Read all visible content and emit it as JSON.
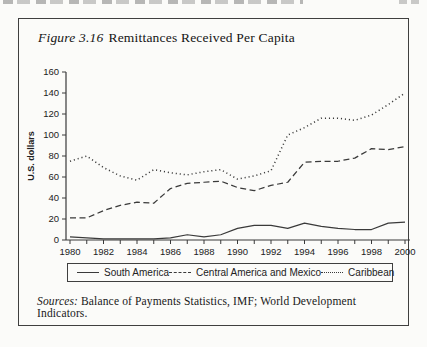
{
  "figure": {
    "label": "Figure 3.16",
    "title": "Remittances Received Per Capita",
    "sources_label": "Sources:",
    "sources_text": "Balance of Payments Statistics, IMF; World Development Indicators."
  },
  "chart_data": {
    "type": "line",
    "title": "Remittances Received Per Capita",
    "xlabel": "",
    "ylabel": "U.S. dollars",
    "ylim": [
      0,
      160
    ],
    "ytick_step": 20,
    "grid": false,
    "legend_position": "bottom",
    "axis_color": "#3a3a3a",
    "line_color": "#3a3a3a",
    "x": [
      1980,
      1981,
      1982,
      1983,
      1984,
      1985,
      1986,
      1987,
      1988,
      1989,
      1990,
      1991,
      1992,
      1993,
      1994,
      1995,
      1996,
      1997,
      1998,
      1999,
      2000
    ],
    "xtick_labels": [
      "1980",
      "1982",
      "1984",
      "1986",
      "1988",
      "1990",
      "1992",
      "1994",
      "1996",
      "1998",
      "2000"
    ],
    "series": [
      {
        "name": "South America",
        "style": "solid",
        "values": [
          3,
          2,
          1,
          1,
          1,
          1,
          2,
          5,
          3,
          5,
          11,
          14,
          14,
          11,
          16,
          13,
          11,
          10,
          10,
          16,
          17
        ]
      },
      {
        "name": "Central America and Mexico",
        "style": "dashed",
        "values": [
          21,
          21,
          28,
          33,
          36,
          35,
          49,
          54,
          55,
          56,
          50,
          47,
          52,
          55,
          74,
          75,
          75,
          78,
          87,
          86,
          89
        ]
      },
      {
        "name": "Caribbean",
        "style": "dotted",
        "values": [
          75,
          80,
          69,
          61,
          57,
          67,
          64,
          62,
          65,
          67,
          58,
          61,
          66,
          100,
          107,
          116,
          116,
          114,
          119,
          129,
          140
        ]
      }
    ]
  }
}
